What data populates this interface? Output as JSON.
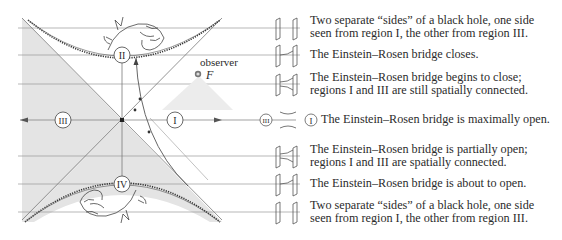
{
  "diagram": {
    "regions": [
      {
        "id": "I",
        "label": "I"
      },
      {
        "id": "II",
        "label": "II"
      },
      {
        "id": "III",
        "label": "III"
      },
      {
        "id": "IV",
        "label": "IV"
      }
    ],
    "observer_label": "observer",
    "observer_symbol": "F",
    "inline_marker_left": "III",
    "inline_marker_right": "I"
  },
  "rows": [
    {
      "lines": [
        "Two separate “sides” of a black hole, one side",
        "seen from region I, the other from region III."
      ]
    },
    {
      "lines": [
        "The Einstein–Rosen bridge closes."
      ]
    },
    {
      "lines": [
        "The Einstein–Rosen bridge begins to close;",
        "regions I and III are still spatially connected."
      ]
    },
    {
      "lines": [
        "The Einstein–Rosen bridge is maximally open."
      ]
    },
    {
      "lines": [
        "The Einstein–Rosen bridge is partially open;",
        "regions I and III are spatially connected."
      ]
    },
    {
      "lines": [
        "The Einstein–Rosen bridge is about to open."
      ]
    },
    {
      "lines": [
        "Two separate “sides” of a black hole, one side",
        "seen from region I, the other from region III."
      ]
    }
  ],
  "colors": {
    "shade": "#e3e3e3",
    "line": "#8a8a8a",
    "ink": "#2b2b2b"
  }
}
